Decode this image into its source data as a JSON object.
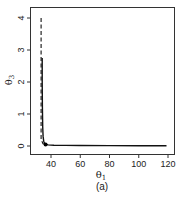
{
  "chart_data": {
    "type": "line",
    "title": "",
    "caption": "(a)",
    "xlabel": "θ1",
    "ylabel": "θ3",
    "xlabel_main": "θ",
    "xlabel_sub": "1",
    "ylabel_main": "θ",
    "ylabel_sub": "3",
    "xlim": [
      28,
      123
    ],
    "ylim": [
      -0.25,
      4.4
    ],
    "xticks": [
      40,
      60,
      80,
      100,
      120
    ],
    "yticks": [
      0,
      1,
      2,
      3,
      4
    ],
    "grid": false,
    "legend": null,
    "series": [
      {
        "name": "solid curve",
        "style": "solid",
        "x": [
          34.0,
          34.0,
          34.1,
          34.3,
          34.6,
          35.0,
          35.5,
          36.5,
          38,
          42,
          50,
          60,
          80,
          100,
          119
        ],
        "y": [
          2.75,
          2.0,
          1.2,
          0.6,
          0.3,
          0.15,
          0.09,
          0.05,
          0.035,
          0.025,
          0.02,
          0.015,
          0.012,
          0.01,
          0.01
        ]
      },
      {
        "name": "dashed line",
        "style": "dashed",
        "x": [
          33.2,
          33.2,
          34.5,
          36.5
        ],
        "y": [
          4.0,
          0.2,
          0.07,
          0.05
        ]
      }
    ],
    "points": [
      {
        "name": "estimate",
        "x": 36.3,
        "y": 0.05
      }
    ]
  }
}
